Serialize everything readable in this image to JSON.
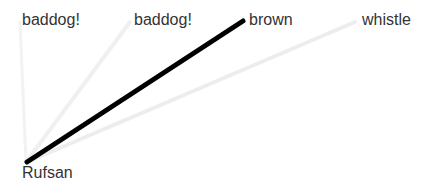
{
  "diagram": {
    "type": "word-association",
    "source": {
      "label": "Rufsan",
      "x": 22,
      "y": 164
    },
    "targets": [
      {
        "label": "baddog!",
        "x": 22,
        "y": 11,
        "weight": 0.04
      },
      {
        "label": "baddog!",
        "x": 134,
        "y": 11,
        "weight": 0.06
      },
      {
        "label": "brown",
        "x": 249,
        "y": 11,
        "weight": 1.0
      },
      {
        "label": "whistle",
        "x": 362,
        "y": 11,
        "weight": 0.08
      }
    ],
    "edges": [
      {
        "from": "Rufsan",
        "to": "baddog!",
        "x1": 26,
        "y1": 162,
        "x2": 20,
        "y2": 22,
        "color": "#f2f2f2",
        "width": 3
      },
      {
        "from": "Rufsan",
        "to": "baddog!",
        "x1": 26,
        "y1": 162,
        "x2": 130,
        "y2": 22,
        "color": "#f0f0f0",
        "width": 4
      },
      {
        "from": "Rufsan",
        "to": "brown",
        "x1": 27,
        "y1": 162,
        "x2": 243,
        "y2": 21,
        "color": "#000000",
        "width": 5
      },
      {
        "from": "Rufsan",
        "to": "whistle",
        "x1": 27,
        "y1": 162,
        "x2": 355,
        "y2": 22,
        "color": "#ededed",
        "width": 4
      }
    ]
  }
}
